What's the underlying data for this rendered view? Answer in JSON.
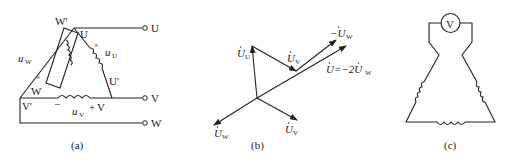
{
  "panels": {
    "a": {
      "caption": "(a)",
      "terminals": [
        "U",
        "V",
        "W"
      ],
      "nodes": {
        "W_prime": "W'",
        "W": "W",
        "U": "U",
        "U_prime": "U'",
        "V_prime": "V'",
        "V": "V"
      },
      "voltages": {
        "uW": "u",
        "uW_sub": "W",
        "uU": "u",
        "uU_sub": "U",
        "uV": "u",
        "uV_sub": "V"
      },
      "polarity": {
        "minus": "−",
        "plus": "+",
        "cross": "×"
      }
    },
    "b": {
      "caption": "(b)",
      "phasors": {
        "UU": "U",
        "UU_sub": "U",
        "UV_top": "U",
        "UV_top_sub": "V",
        "neg_UW": "−U",
        "neg_UW_sub": "W",
        "sum": "U=−2U",
        "sum_sub": "W",
        "UW": "U",
        "UW_sub": "W",
        "UV": "U",
        "UV_sub": "V"
      }
    },
    "c": {
      "caption": "(c)",
      "meter": "V"
    }
  },
  "colors": {
    "ink": "#222222",
    "background": "#ffffff"
  }
}
